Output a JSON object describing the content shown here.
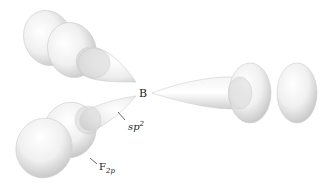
{
  "diagram": {
    "type": "orbital-overlap",
    "central_atom": {
      "label": "B"
    },
    "hybrid_label": {
      "base": "sp",
      "superscript": "2"
    },
    "fluorine_label": {
      "base": "F",
      "subscript": "2p"
    },
    "orbitals": [
      {
        "name": "sp2-lobe-upper-left",
        "kind": "sp2 hybrid",
        "direction": "upper-left"
      },
      {
        "name": "sp2-lobe-right",
        "kind": "sp2 hybrid",
        "direction": "right"
      },
      {
        "name": "sp2-lobe-lower-left",
        "kind": "sp2 hybrid",
        "direction": "lower-left"
      },
      {
        "name": "f2p-upper-left",
        "kind": "F 2p",
        "direction": "upper-left"
      },
      {
        "name": "f2p-right",
        "kind": "F 2p",
        "direction": "right"
      },
      {
        "name": "f2p-lower-left",
        "kind": "F 2p",
        "direction": "lower-left"
      }
    ],
    "colors": {
      "lobe_light": "#fafafa",
      "lobe_dark": "#c8c8c8",
      "overlap": "#b8b8b8",
      "background": "#ffffff"
    }
  }
}
